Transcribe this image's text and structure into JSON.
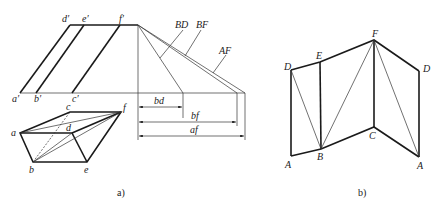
{
  "figure_a": {
    "caption": "a)",
    "front_view_labels": {
      "a_prime": "a′",
      "b_prime": "b′",
      "c_prime": "c′",
      "d_prime": "d′",
      "e_prime": "e′",
      "f_prime": "f′"
    },
    "true_length_labels": {
      "BD": "BD",
      "BF": "BF",
      "AF": "AF"
    },
    "dimension_labels": {
      "bd": "bd",
      "bf": "bf",
      "af": "af"
    },
    "top_view_labels": {
      "a": "a",
      "b": "b",
      "c": "c",
      "d": "d",
      "e": "e",
      "f": "f"
    }
  },
  "figure_b": {
    "caption": "b)",
    "labels": {
      "D_left": "D",
      "E": "E",
      "F": "F",
      "D_right": "D",
      "A_left": "A",
      "B": "B",
      "C": "C",
      "A_right": "A"
    }
  }
}
